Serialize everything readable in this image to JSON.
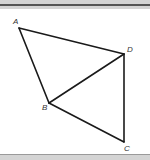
{
  "figure": {
    "type": "geometry",
    "stroke_color": "#1a1a1a",
    "points": [
      {
        "id": "A",
        "label": "A",
        "x": 19,
        "y": 28,
        "lx": 13,
        "ly": 24
      },
      {
        "id": "D",
        "label": "D",
        "x": 124,
        "y": 54,
        "lx": 127,
        "ly": 52
      },
      {
        "id": "B",
        "label": "B",
        "x": 49,
        "y": 103,
        "lx": 42,
        "ly": 110
      },
      {
        "id": "C",
        "label": "C",
        "x": 124,
        "y": 142,
        "lx": 124,
        "ly": 151
      }
    ],
    "segments": [
      [
        "A",
        "D"
      ],
      [
        "A",
        "B"
      ],
      [
        "B",
        "D"
      ],
      [
        "B",
        "C"
      ],
      [
        "D",
        "C"
      ]
    ]
  },
  "labels": {
    "A": "A",
    "B": "B",
    "C": "C",
    "D": "D"
  }
}
